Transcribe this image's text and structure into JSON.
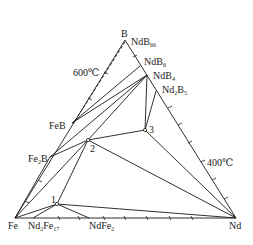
{
  "diagram": {
    "type": "ternary-phase-diagram",
    "corners": {
      "top": "B",
      "left": "Fe",
      "right": "Nd"
    },
    "temperature_labels": [
      {
        "text": "600℃",
        "side": "left"
      },
      {
        "text": "400℃",
        "side": "right"
      }
    ],
    "phases": [
      {
        "name": "NdB",
        "sub": "66"
      },
      {
        "name": "NdB",
        "sub": "6"
      },
      {
        "name": "NdB",
        "sub": "4"
      },
      {
        "name": "Nd",
        "sub": "2",
        "name2": "B",
        "sub2": "5"
      },
      {
        "name": "FeB"
      },
      {
        "name": "Fe",
        "sub": "2",
        "name2": "B"
      },
      {
        "name": "Nd",
        "sub": "2",
        "name2": "Fe",
        "sub2": "17"
      },
      {
        "name": "NdFe",
        "sub": "2"
      }
    ],
    "ternary_points": [
      "1",
      "2",
      "3"
    ],
    "colors": {
      "line": "#1a1a1a",
      "background": "#ffffff"
    }
  }
}
